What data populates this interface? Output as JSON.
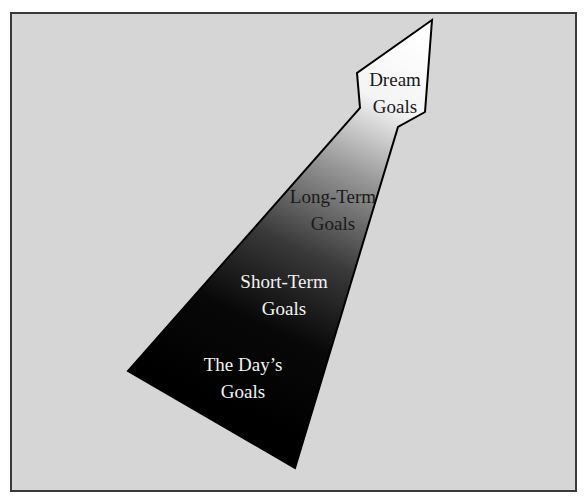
{
  "diagram": {
    "type": "goal-hierarchy-arrow",
    "direction": "bottom-left to top-right",
    "levels": [
      {
        "line1": "Dream",
        "line2": "Goals",
        "text_color": "#1a1a1a"
      },
      {
        "line1": "Long-Term",
        "line2": "Goals",
        "text_color": "#1a1a1a"
      },
      {
        "line1": "Short-Term",
        "line2": "Goals",
        "text_color": "#f2f2f2"
      },
      {
        "line1": "The Day’s",
        "line2": "Goals",
        "text_color": "#f2f2f2"
      }
    ],
    "colors": {
      "background": "#d6d6d6",
      "border": "#3a3a3a",
      "arrow_tip": "#ffffff",
      "arrow_base": "#000000"
    }
  }
}
